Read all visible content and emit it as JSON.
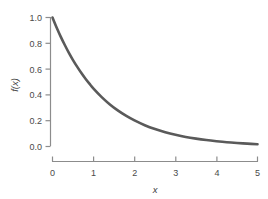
{
  "chart_data": {
    "type": "line",
    "title": "",
    "subtitle": "",
    "xlabel": "x",
    "ylabel": "f(x)",
    "xlim": [
      0,
      5
    ],
    "ylim": [
      0.0,
      1.0
    ],
    "xticks": [
      "0",
      "1",
      "2",
      "3",
      "4",
      "5"
    ],
    "xtick_values": [
      0,
      1,
      2,
      3,
      4,
      5
    ],
    "yticks": [
      "0.0",
      "0.2",
      "0.4",
      "0.6",
      "0.8",
      "1.0"
    ],
    "ytick_values": [
      0.0,
      0.2,
      0.4,
      0.6,
      0.8,
      1.0
    ],
    "grid": false,
    "legend": null,
    "legend_position": "none",
    "annotations": [],
    "series": [
      {
        "name": "f(x)",
        "equation": "exp(-0.8x)",
        "color": "#5a5a5a",
        "linewidth": 2.6,
        "x": [
          0.0,
          0.1,
          0.2,
          0.3,
          0.4,
          0.5,
          0.6,
          0.7,
          0.8,
          0.9,
          1.0,
          1.2,
          1.4,
          1.6,
          1.8,
          2.0,
          2.25,
          2.5,
          2.75,
          3.0,
          3.25,
          3.5,
          3.75,
          4.0,
          4.25,
          4.5,
          4.75,
          5.0
        ],
        "values": [
          1.0,
          0.923,
          0.852,
          0.787,
          0.726,
          0.67,
          0.619,
          0.571,
          0.527,
          0.487,
          0.449,
          0.383,
          0.326,
          0.278,
          0.237,
          0.202,
          0.165,
          0.135,
          0.111,
          0.091,
          0.074,
          0.061,
          0.05,
          0.041,
          0.033,
          0.027,
          0.022,
          0.018
        ]
      }
    ]
  },
  "axes": {
    "axis_color": "#8c8c8c",
    "tick_color": "#8c8c8c",
    "text_color": "#4a4a4a",
    "background": "#ffffff"
  }
}
